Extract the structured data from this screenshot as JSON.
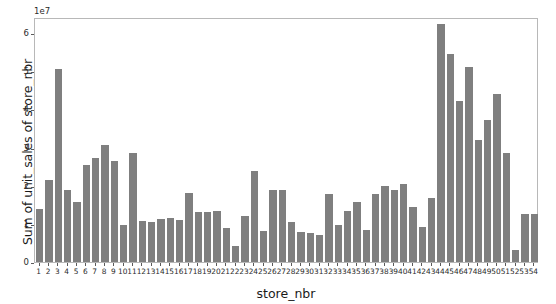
{
  "chart_data": {
    "type": "bar",
    "title": "",
    "xlabel": "store_nbr",
    "ylabel": "Sum of unit_sales of store_nbr",
    "offset_text": "1e7",
    "y_scale_factor": 10000000,
    "ylim": [
      0,
      6.42
    ],
    "yticks": [
      0,
      1,
      2,
      3,
      4,
      5,
      6
    ],
    "ytick_labels": [
      "0",
      "1",
      "2",
      "3",
      "4",
      "5",
      "6"
    ],
    "grid": false,
    "legend": null,
    "bar_color": "#7f7f7f",
    "frame_color": "#b8b8b8",
    "categories": [
      "1",
      "2",
      "3",
      "4",
      "5",
      "6",
      "7",
      "8",
      "9",
      "10",
      "11",
      "12",
      "13",
      "14",
      "15",
      "16",
      "17",
      "18",
      "19",
      "20",
      "21",
      "22",
      "23",
      "24",
      "25",
      "26",
      "27",
      "28",
      "29",
      "30",
      "31",
      "32",
      "33",
      "34",
      "35",
      "36",
      "37",
      "38",
      "39",
      "40",
      "41",
      "42",
      "43",
      "44",
      "45",
      "46",
      "47",
      "48",
      "49",
      "50",
      "51",
      "52",
      "53",
      "54"
    ],
    "values": [
      1.4,
      2.15,
      5.05,
      1.9,
      1.56,
      2.53,
      2.72,
      3.06,
      2.66,
      0.98,
      2.85,
      1.07,
      1.05,
      1.13,
      1.16,
      1.1,
      1.81,
      1.32,
      1.32,
      1.33,
      0.89,
      0.42,
      1.2,
      2.38,
      0.81,
      1.9,
      1.89,
      1.06,
      0.79,
      0.76,
      0.72,
      1.77,
      0.97,
      1.33,
      1.58,
      0.85,
      1.77,
      1.98,
      1.88,
      2.04,
      1.45,
      0.92,
      1.68,
      6.25,
      5.45,
      4.23,
      5.1,
      3.2,
      3.73,
      4.4,
      2.86,
      0.32,
      1.26,
      1.26
    ]
  }
}
